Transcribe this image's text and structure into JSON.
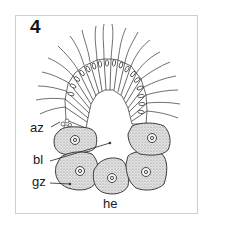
{
  "figure": {
    "number": "4",
    "labels": {
      "az": "az",
      "bl": "bl",
      "gz": "gz",
      "he": "he"
    },
    "colors": {
      "line": "#2a2a2a",
      "stipple_fill": "#d6d6d6",
      "frame": "#cfcfcf",
      "background": "#ffffff"
    }
  }
}
